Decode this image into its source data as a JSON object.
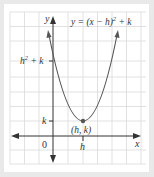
{
  "figure": {
    "equation": "y = (x − h)² + k",
    "equation_parts": {
      "lhs": "y = (x − h)",
      "exp": "2",
      "rhs": " + k"
    },
    "axis_labels": {
      "x": "x",
      "y": "y"
    },
    "origin_label": "0",
    "y_ticks": {
      "upper": {
        "base": "h",
        "exp": "2",
        "rest": " + k"
      },
      "lower": "k"
    },
    "x_ticks": {
      "h": "h"
    },
    "vertex_label": "(h, k)",
    "colors": {
      "curve": "#555555",
      "axis": "#333333",
      "grid": "#d9d9d9",
      "panel": "#ffffff",
      "background": "#e9e9e9"
    }
  }
}
